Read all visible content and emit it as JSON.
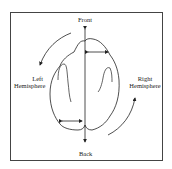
{
  "diagram": {
    "labels": {
      "front": "Front",
      "back": "Back",
      "left_line1": "Left",
      "left_line2": "Hemisphere",
      "right_line1": "Right",
      "right_line2": "Hemisphere"
    },
    "stroke_color": "#222222"
  }
}
